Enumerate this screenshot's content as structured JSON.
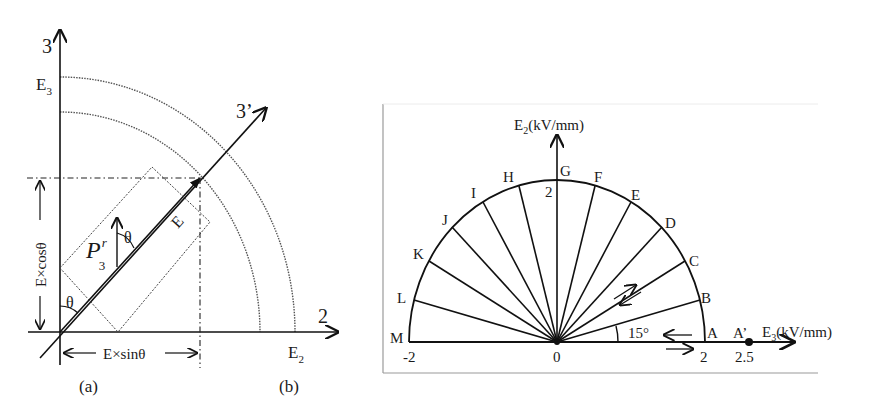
{
  "figure": {
    "panel_a": {
      "caption": "(a)",
      "axes": {
        "vertical": "3",
        "horizontal": "2",
        "rotated": "3’"
      },
      "labels": {
        "e3": "E",
        "e3_sub": "3",
        "e2": "E",
        "e2_sub": "2",
        "field_vector": "E",
        "polarization": "P",
        "polarization_sup": "r",
        "polarization_sub": "3",
        "theta_origin": "θ",
        "theta_polarization": "θ",
        "vertical_component": "E×cosθ",
        "horizontal_component": "E×sinθ"
      }
    },
    "panel_b": {
      "caption": "(b)",
      "y_axis_label": "E",
      "y_axis_sub": "2",
      "y_axis_unit": "(kV/mm)",
      "x_axis_label": "E",
      "x_axis_sub": "3",
      "x_axis_unit": "(kV/mm)",
      "angle_label": "15°",
      "ticks": {
        "x_neg": "-2",
        "origin": "0",
        "x_pos": "2",
        "x_extra": "2.5",
        "y_top": "2"
      },
      "points": [
        "A",
        "B",
        "C",
        "D",
        "E",
        "F",
        "G",
        "H",
        "I",
        "J",
        "K",
        "L",
        "M"
      ],
      "extra_point": "A’",
      "step_deg": 15,
      "radius_kv_per_mm": 2
    }
  },
  "colors": {
    "line": "#111111",
    "dotted": "#555555",
    "frame": "#9a9a9a",
    "background": "#ffffff"
  }
}
